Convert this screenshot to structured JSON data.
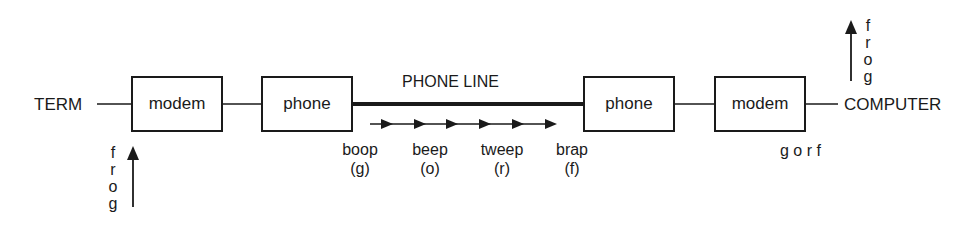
{
  "diagram": {
    "type": "signal-flow",
    "endpoints": {
      "left": "TERM",
      "right": "COMPUTER"
    },
    "boxes": [
      {
        "id": "modem-left",
        "label": "modem"
      },
      {
        "id": "phone-left",
        "label": "phone"
      },
      {
        "id": "phone-right",
        "label": "phone"
      },
      {
        "id": "modem-right",
        "label": "modem"
      }
    ],
    "line_label": "PHONE LINE",
    "tones": [
      {
        "sound": "boop",
        "letter": "(g)"
      },
      {
        "sound": "beep",
        "letter": "(o)"
      },
      {
        "sound": "tweep",
        "letter": "(r)"
      },
      {
        "sound": "brap",
        "letter": "(f)"
      }
    ],
    "input_stack": {
      "letters": [
        "f",
        "r",
        "o",
        "g"
      ],
      "direction": "up"
    },
    "output_stack": {
      "letters": [
        "f",
        "r",
        "o",
        "g"
      ],
      "direction": "up"
    },
    "received_sequence": "g o r f",
    "colors": {
      "ink": "#1a1a1a",
      "background": "#ffffff"
    }
  }
}
